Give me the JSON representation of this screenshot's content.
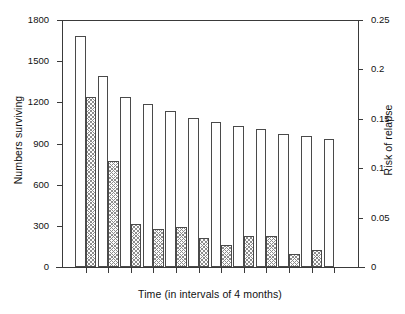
{
  "chart_data": {
    "type": "bar",
    "title": "",
    "xlabel": "Time (in intervals of 4 months)",
    "ylabel": "Numbers surviving",
    "ylabel_right": "Risk of relapse",
    "grid": false,
    "legend": null,
    "ylim": [
      0,
      1800
    ],
    "ylim_right": [
      0,
      0.25
    ],
    "yticks": [
      0,
      300,
      600,
      900,
      1200,
      1500,
      1800
    ],
    "ytick_labels": [
      "0",
      "300",
      "600",
      "900",
      "1200",
      "1500",
      "1800"
    ],
    "yticks_right": [
      0,
      0.05,
      0.1,
      0.15,
      0.2,
      0.25
    ],
    "ytick_labels_right": [
      "0",
      "0.05",
      "0.1",
      "0.15",
      "0.2",
      "0.25"
    ],
    "xticks": [
      1,
      2,
      3,
      4,
      5,
      6,
      7,
      8,
      9,
      10,
      11,
      12
    ],
    "xtick_labels": [],
    "series": [
      {
        "name": "Numbers surviving",
        "axis": "left",
        "style": "open",
        "values": [
          1680,
          1390,
          1240,
          1185,
          1135,
          1085,
          1060,
          1030,
          1005,
          970,
          955,
          935
        ]
      },
      {
        "name": "Risk of relapse",
        "axis": "right",
        "style": "hatched",
        "values": [
          0.172,
          0.107,
          0.044,
          0.038,
          0.041,
          0.029,
          0.022,
          0.031,
          0.031,
          0.013,
          0.017
        ]
      }
    ]
  },
  "colors": {
    "axis": "#3a3a3a",
    "bar_outline": "#4a4a4a",
    "bar_open_fill": "#ffffff",
    "bar_hatch": "#8d8d8d",
    "background": "#ffffff",
    "text": "#111111"
  }
}
